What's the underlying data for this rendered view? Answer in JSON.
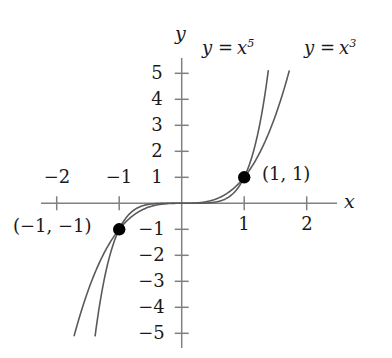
{
  "figure": {
    "kind": "cartesian-plot",
    "width": 392,
    "height": 358,
    "background": "#ffffff"
  },
  "axes": {
    "x_axis_label": "x",
    "y_axis_label": "y",
    "axis_color": "#808080",
    "x_ticks": [
      {
        "value": -2,
        "label": "−2",
        "side": "above"
      },
      {
        "value": -1,
        "label": "−1",
        "side": "above"
      },
      {
        "value": 1,
        "label": "1",
        "side": "below"
      },
      {
        "value": 2,
        "label": "2",
        "side": "below"
      }
    ],
    "y_ticks": [
      {
        "value": 5,
        "label": "5"
      },
      {
        "value": 4,
        "label": "4"
      },
      {
        "value": 3,
        "label": "3"
      },
      {
        "value": 2,
        "label": "2"
      },
      {
        "value": 1,
        "label": "1"
      },
      {
        "value": -1,
        "label": "−1"
      },
      {
        "value": -2,
        "label": "−2"
      },
      {
        "value": -3,
        "label": "−3"
      },
      {
        "value": -4,
        "label": "−4"
      },
      {
        "value": -5,
        "label": "−5"
      }
    ]
  },
  "curve_labels": {
    "quintic": {
      "lhs": "y =",
      "base": "x",
      "exponent": "5"
    },
    "cubic": {
      "lhs": "y =",
      "base": "x",
      "exponent": "3"
    }
  },
  "points": [
    {
      "name": "intersection-positive",
      "label": "(1, 1)",
      "x": 1,
      "y": 1
    },
    {
      "name": "intersection-negative",
      "label": "(−1, −1)",
      "x": -1,
      "y": -1
    }
  ],
  "chart_data": {
    "type": "line",
    "title": "",
    "xlabel": "x",
    "ylabel": "y",
    "xlim": [
      -2.25,
      2.55
    ],
    "ylim": [
      -5.5,
      5.5
    ],
    "grid": false,
    "legend": "inline-curve-labels",
    "origin_px": {
      "x": 181.7,
      "y": 203.3
    },
    "scale_px_per_unit": {
      "x": 62.5,
      "y": 26.0
    },
    "xticks": [
      -2,
      -1,
      1,
      2
    ],
    "yticks": [
      5,
      4,
      3,
      2,
      1,
      -1,
      -2,
      -3,
      -4,
      -5
    ],
    "series": [
      {
        "name": "y = x^5",
        "expression": "x**5",
        "color": "#5a5a5a",
        "linewidth": 1.6,
        "x_domain": [
          -1.385,
          1.385
        ],
        "x": [
          -1.385,
          -1.3,
          -1.2,
          -1.1,
          -1.0,
          -0.9,
          -0.8,
          -0.7,
          -0.6,
          -0.5,
          -0.4,
          -0.3,
          -0.2,
          -0.1,
          0.0,
          0.1,
          0.2,
          0.3,
          0.4,
          0.5,
          0.6,
          0.7,
          0.8,
          0.9,
          1.0,
          1.1,
          1.2,
          1.3,
          1.385
        ],
        "y": [
          -5.1,
          -3.71,
          -2.49,
          -1.61,
          -1.0,
          -0.59,
          -0.33,
          -0.17,
          -0.078,
          -0.031,
          -0.01,
          -0.0024,
          -0.00032,
          -1e-05,
          0.0,
          1e-05,
          0.00032,
          0.0024,
          0.01,
          0.031,
          0.078,
          0.17,
          0.33,
          0.59,
          1.0,
          1.61,
          2.49,
          3.71,
          5.1
        ]
      },
      {
        "name": "y = x^3",
        "expression": "x**3",
        "color": "#5a5a5a",
        "linewidth": 1.6,
        "x_domain": [
          -1.72,
          1.72
        ],
        "x": [
          -1.72,
          -1.6,
          -1.4,
          -1.2,
          -1.0,
          -0.9,
          -0.8,
          -0.7,
          -0.6,
          -0.5,
          -0.4,
          -0.3,
          -0.2,
          -0.1,
          0.0,
          0.1,
          0.2,
          0.3,
          0.4,
          0.5,
          0.6,
          0.7,
          0.8,
          0.9,
          1.0,
          1.2,
          1.4,
          1.6,
          1.72
        ],
        "y": [
          -5.09,
          -4.1,
          -2.74,
          -1.73,
          -1.0,
          -0.729,
          -0.512,
          -0.343,
          -0.216,
          -0.125,
          -0.064,
          -0.027,
          -0.008,
          -0.001,
          0.0,
          0.001,
          0.008,
          0.027,
          0.064,
          0.125,
          0.216,
          0.343,
          0.512,
          0.729,
          1.0,
          1.73,
          2.74,
          4.1,
          5.09
        ]
      }
    ],
    "annotated_points": [
      {
        "label": "(1, 1)",
        "x": 1,
        "y": 1
      },
      {
        "label": "(−1, −1)",
        "x": -1,
        "y": -1
      }
    ]
  },
  "colors": {
    "curve": "#5a5a5a",
    "axis": "#808080",
    "text": "#1a1a1a",
    "point": "#000000"
  }
}
